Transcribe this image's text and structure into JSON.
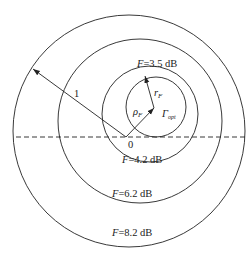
{
  "colors": {
    "stroke": "#222222",
    "background": "#ffffff"
  },
  "origin_label": "0",
  "unit_radius_label": "1",
  "vectors": {
    "rho": {
      "symbol": "ρ",
      "subscript": "F"
    },
    "r": {
      "symbol": "r",
      "subscript": "F"
    },
    "gamma": {
      "symbol": "Γ",
      "subscript": "opt"
    }
  },
  "circles": [
    {
      "label_var": "F",
      "label_value": "=3.5 dB",
      "cx": 154,
      "cy": 108,
      "r": 29
    },
    {
      "label_var": "F",
      "label_value": "=4.2 dB",
      "cx": 150,
      "cy": 114,
      "r": 48
    },
    {
      "label_var": "F",
      "label_value": "=6.2 dB",
      "cx": 140,
      "cy": 121,
      "r": 82
    },
    {
      "label_var": "F",
      "label_value": "=8.2 dB",
      "cx": 129,
      "cy": 131,
      "r": 116
    }
  ]
}
